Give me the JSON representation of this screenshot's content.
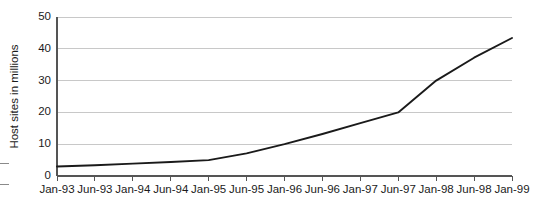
{
  "chart_data": {
    "type": "line",
    "title": "",
    "subtitle": "",
    "xlabel": "",
    "ylabel": "Host sites in millions",
    "categories": [
      "Jan-93",
      "Jun-93",
      "Jan-94",
      "Jun-94",
      "Jan-95",
      "Jun-95",
      "Jan-96",
      "Jun-96",
      "Jan-97",
      "Jun-97",
      "Jan-98",
      "Jun-98",
      "Jan-99"
    ],
    "values": [
      3.0,
      3.4,
      3.9,
      4.4,
      5.0,
      7.1,
      10.0,
      13.2,
      16.6,
      20.0,
      30.0,
      37.2,
      43.4
    ],
    "series": [
      {
        "name": "Host sites",
        "values": [
          3.0,
          3.4,
          3.9,
          4.4,
          5.0,
          7.1,
          10.0,
          13.2,
          16.6,
          20.0,
          30.0,
          37.2,
          43.4
        ]
      }
    ],
    "ylim": [
      0,
      50
    ],
    "ytick_labels": [
      "0",
      "10",
      "20",
      "30",
      "40",
      "50"
    ],
    "ytick_values": [
      0,
      10,
      20,
      30,
      40,
      50
    ],
    "grid": "horizontal",
    "legend": "none",
    "line_color": "#1a1a1a",
    "grid_color": "#c8c8c8",
    "axis_color": "#555555",
    "background_color": "#ffffff"
  },
  "layout": {
    "plot_left": 57,
    "plot_right": 512,
    "plot_top": 17,
    "plot_bottom": 176
  }
}
